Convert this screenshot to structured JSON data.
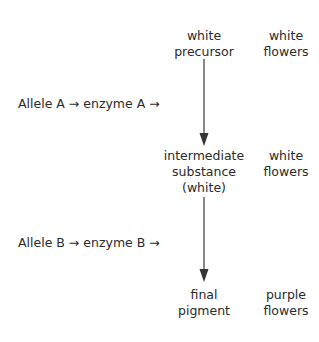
{
  "diagram": {
    "type": "biochemical pathway",
    "nodes": [
      {
        "id": "precursor",
        "lines": [
          "white",
          "precursor"
        ],
        "phenotype": [
          "white",
          "flowers"
        ]
      },
      {
        "id": "intermediate",
        "lines": [
          "intermediate",
          "substance",
          "(white)"
        ],
        "phenotype": [
          "white",
          "flowers"
        ]
      },
      {
        "id": "final",
        "lines": [
          "final",
          "pigment"
        ],
        "phenotype": [
          "purple",
          "flowers"
        ]
      }
    ],
    "steps": [
      {
        "from": "precursor",
        "to": "intermediate",
        "label": "Allele A  → enzyme A →"
      },
      {
        "from": "intermediate",
        "to": "final",
        "label": "Allele B → enzyme B →"
      }
    ],
    "arrow_color": "#555555",
    "text_color": "#2a2a2a"
  }
}
